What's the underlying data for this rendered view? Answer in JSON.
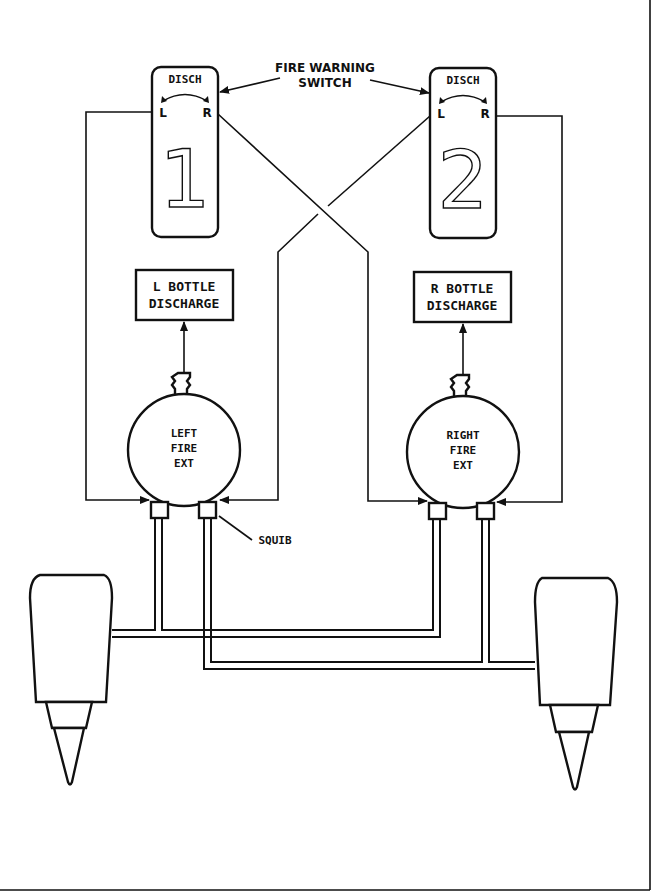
{
  "diagram": {
    "callouts": {
      "fire_warning_switch_line1": "FIRE WARNING",
      "fire_warning_switch_line2": "SWITCH",
      "squib": "SQUIB"
    },
    "switches": [
      {
        "id": "switch-1",
        "top_label": "DISCH",
        "left_label": "L",
        "right_label": "R",
        "number": "1"
      },
      {
        "id": "switch-2",
        "top_label": "DISCH",
        "left_label": "L",
        "right_label": "R",
        "number": "2"
      }
    ],
    "indicators": [
      {
        "id": "l-bottle-discharge",
        "line1": "L BOTTLE",
        "line2": "DISCHARGE"
      },
      {
        "id": "r-bottle-discharge",
        "line1": "R BOTTLE",
        "line2": "DISCHARGE"
      }
    ],
    "bottles": [
      {
        "id": "left-fire-ext",
        "line1": "LEFT",
        "line2": "FIRE",
        "line3": "EXT"
      },
      {
        "id": "right-fire-ext",
        "line1": "RIGHT",
        "line2": "FIRE",
        "line3": "EXT"
      }
    ],
    "engines": [
      {
        "id": "left-engine"
      },
      {
        "id": "right-engine"
      }
    ],
    "colors": {
      "ink": "#111111",
      "paper": "#ffffff"
    }
  }
}
